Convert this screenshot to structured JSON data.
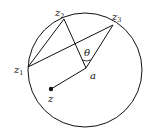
{
  "diagram": {
    "type": "geometry",
    "circle": {
      "cx": 85,
      "cy": 70,
      "r": 57
    },
    "points": {
      "z1": {
        "x": 28,
        "y": 67,
        "label": "z",
        "sub": "1"
      },
      "z2": {
        "x": 64,
        "y": 19,
        "label": "z",
        "sub": "2"
      },
      "z3": {
        "x": 113,
        "y": 25,
        "label": "z",
        "sub": "3"
      },
      "a": {
        "x": 86,
        "y": 68,
        "label": "a"
      },
      "z": {
        "x": 51,
        "y": 89,
        "label": "z"
      }
    },
    "angle_label": "θ",
    "colors": {
      "stroke": "#111111",
      "background": "#ffffff"
    }
  }
}
